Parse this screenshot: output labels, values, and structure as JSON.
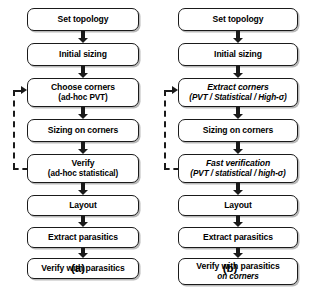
{
  "figure": {
    "background_color": "#ffffff",
    "line_color": "#1a1a1a",
    "shadow_color": "#b9b9b9"
  },
  "columns": [
    {
      "caption": "(a)",
      "boxes": [
        {
          "line1": "Set topology",
          "line2": ""
        },
        {
          "line1": "Initial sizing",
          "line2": ""
        },
        {
          "line1": "Choose corners",
          "line2": "(ad-hoc PVT)"
        },
        {
          "line1": "Sizing on corners",
          "line2": ""
        },
        {
          "line1": "Verify",
          "line2": "(ad-hoc statistical)"
        },
        {
          "line1": "Layout",
          "line2": ""
        },
        {
          "line1": "Extract parasitics",
          "line2": ""
        },
        {
          "line1": "Verify with parasitics",
          "line2": ""
        }
      ],
      "feedback": {
        "from_box": 4,
        "to_box": 2,
        "style": "dashed"
      }
    },
    {
      "caption": "(b)",
      "boxes": [
        {
          "line1": "Set topology",
          "line2": ""
        },
        {
          "line1": "Initial sizing",
          "line2": ""
        },
        {
          "line1": "Extract corners",
          "line2": "(PVT / Statistical / High-σ)"
        },
        {
          "line1": "Sizing on corners",
          "line2": ""
        },
        {
          "line1": "Fast verification",
          "line2": "(PVT / statistical / high-σ)"
        },
        {
          "line1": "Layout",
          "line2": ""
        },
        {
          "line1": "Extract parasitics",
          "line2": ""
        },
        {
          "line1": "Verify with parasitics",
          "line2": "on corners"
        }
      ],
      "feedback": {
        "from_box": 4,
        "to_box": 2,
        "style": "dashed"
      }
    }
  ]
}
